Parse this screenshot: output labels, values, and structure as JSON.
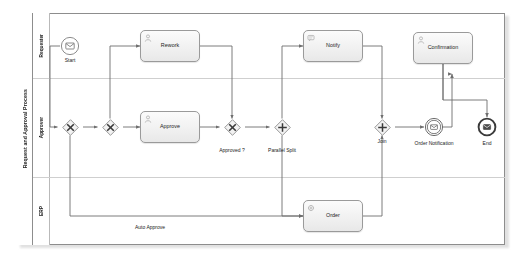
{
  "pool": {
    "name": "Request and Approval Process",
    "lanes": [
      {
        "id": "requester",
        "label": "Requester"
      },
      {
        "id": "approver",
        "label": "Approver"
      },
      {
        "id": "erp",
        "label": "ERP"
      }
    ]
  },
  "nodes": {
    "start": {
      "label": "Start",
      "type": "message-start-event",
      "icon": "envelope-icon"
    },
    "rework": {
      "label": "Rework",
      "type": "user-task",
      "icon": "user-task-icon"
    },
    "gw_merge": {
      "label": "",
      "type": "exclusive-gateway",
      "icon": "x-gateway-icon"
    },
    "gw_loop": {
      "label": "",
      "type": "exclusive-gateway",
      "icon": "x-gateway-icon"
    },
    "approve": {
      "label": "Approve",
      "type": "user-task",
      "icon": "user-task-icon"
    },
    "gw_approved": {
      "label": "Approved ?",
      "type": "exclusive-gateway",
      "icon": "x-gateway-icon"
    },
    "gw_split": {
      "label": "Parallel Split",
      "type": "parallel-gateway",
      "icon": "plus-gateway-icon"
    },
    "notify": {
      "label": "Notify",
      "type": "send-task",
      "icon": "send-task-icon"
    },
    "order": {
      "label": "Order",
      "type": "service-task",
      "icon": "service-task-icon"
    },
    "gw_join": {
      "label": "Join",
      "type": "parallel-gateway",
      "icon": "plus-gateway-icon"
    },
    "order_notif": {
      "label": "Order Notification",
      "type": "intermediate-message-event",
      "icon": "envelope-icon"
    },
    "confirmation": {
      "label": "Confirmation",
      "type": "user-task",
      "icon": "user-task-icon"
    },
    "end": {
      "label": "End",
      "type": "message-end-event",
      "icon": "envelope-filled-icon"
    }
  },
  "edge_labels": {
    "auto_approve": "Auto Approve"
  },
  "colors": {
    "pool_border": "#8d8d8d",
    "lane_border": "#cfcfcf",
    "shape_border": "#9a9a9a",
    "shape_fill_top": "#fbfbfb",
    "shape_fill_bottom": "#e8e8e8",
    "edge": "#6e6e6e",
    "text": "#1b1b1b"
  }
}
